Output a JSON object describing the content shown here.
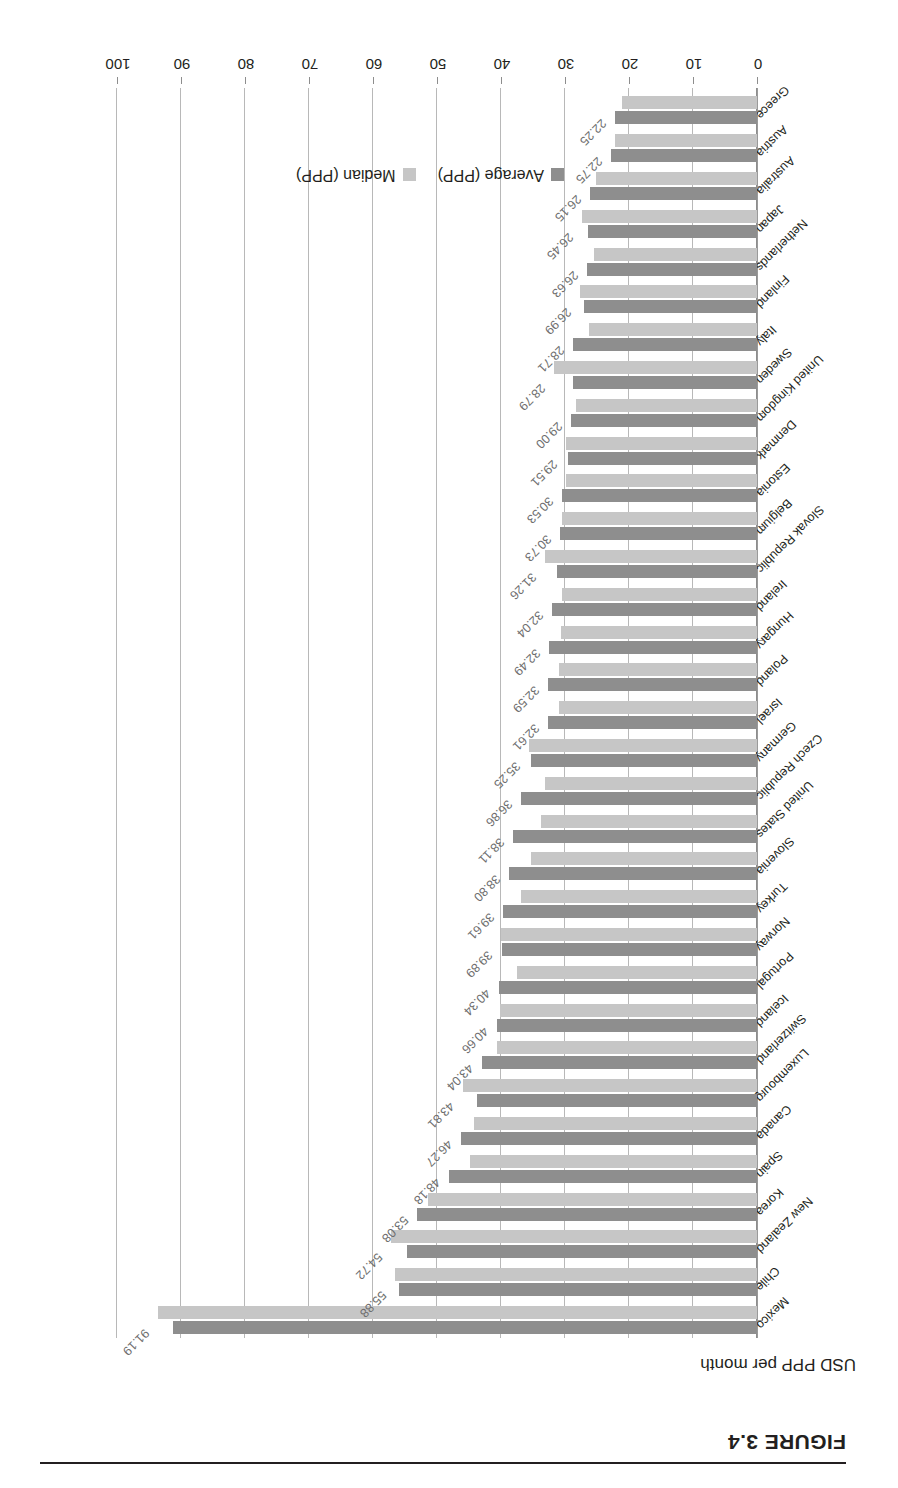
{
  "figure": {
    "caption": "FIGURE 3.4"
  },
  "chart_data": {
    "type": "bar",
    "orientation": "horizontal",
    "title": "",
    "xlabel": "USD PPP per month",
    "ylabel": "",
    "xlim": [
      0,
      100
    ],
    "xticks": [
      "0",
      "10",
      "20",
      "30",
      "40",
      "50",
      "60",
      "70",
      "80",
      "90",
      "100"
    ],
    "grid": true,
    "legend_position": "bottom-center",
    "legend": [
      "Average (PPP)",
      "Median (PPP)"
    ],
    "colors": {
      "average": "#8e8e8e",
      "median": "#c6c6c6",
      "gridline": "#b8b8b8",
      "label": "#6e6e6e"
    },
    "categories": [
      "Mexico",
      "Chile",
      "New Zealand",
      "Korea",
      "Spain",
      "Canada",
      "Luxembourg",
      "Switzerland",
      "Iceland",
      "Portugal",
      "Norway",
      "Turkey",
      "Slovenia",
      "United States",
      "Czech Republic",
      "Germany",
      "Israel",
      "Poland",
      "Hungary",
      "Ireland",
      "Slovak Republic",
      "Belgium",
      "Estonia",
      "Denmark",
      "United Kingdom",
      "Sweden",
      "Italy",
      "Finland",
      "Netherlands",
      "Japan",
      "Australia",
      "Austria",
      "Greece"
    ],
    "series": [
      {
        "name": "Average (PPP)",
        "values": [
          91.19,
          55.88,
          54.72,
          53.08,
          48.18,
          46.27,
          43.81,
          43.04,
          40.66,
          40.34,
          39.89,
          39.61,
          38.8,
          38.11,
          36.86,
          35.25,
          32.61,
          32.59,
          32.49,
          32.04,
          31.26,
          30.73,
          30.53,
          29.51,
          29.0,
          28.79,
          28.71,
          26.99,
          26.63,
          26.45,
          26.15,
          22.75,
          22.25
        ]
      },
      {
        "name": "Median (PPP)",
        "values": [
          93.6,
          56.6,
          57.2,
          51.4,
          44.9,
          44.2,
          46.0,
          40.6,
          40.1,
          37.5,
          40.0,
          36.9,
          35.3,
          33.8,
          33.2,
          35.6,
          30.9,
          31.0,
          30.6,
          30.5,
          33.1,
          30.4,
          29.8,
          29.9,
          28.3,
          31.7,
          26.2,
          27.6,
          25.4,
          27.4,
          25.2,
          22.2,
          21.1
        ]
      }
    ],
    "data_labels": [
      "91.19",
      "55.88",
      "54.72",
      "53.08",
      "48.18",
      "46.27",
      "43.81",
      "43.04",
      "40.66",
      "40.34",
      "39.89",
      "39.61",
      "38.80",
      "38.11",
      "36.86",
      "35.25",
      "32.61",
      "32.59",
      "32.49",
      "32.04",
      "31.26",
      "30.73",
      "30.53",
      "29.51",
      "29.00",
      "28.79",
      "28.71",
      "26.99",
      "26.63",
      "26.45",
      "26.15",
      "22.75",
      "22.25"
    ]
  }
}
